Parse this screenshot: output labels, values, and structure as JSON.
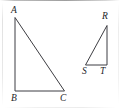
{
  "figure": {
    "name": "two-right-triangles-diagram",
    "background_color": "#ffffff",
    "stroke_color": "#3d3d42",
    "label_color": "#242428",
    "width": 120,
    "height": 109
  },
  "shapes": [
    {
      "name": "triangle-ABC",
      "points": "15,18 15,91 64,91",
      "right_angle_at": "B"
    },
    {
      "name": "triangle-RST",
      "points": "107,26 107,65 86,65",
      "right_angle_at": "T"
    }
  ],
  "labels": {
    "a": "A",
    "b": "B",
    "c": "C",
    "r": "R",
    "s": "S",
    "t": "T"
  },
  "label_positions": {
    "a": {
      "left": 11,
      "top": 5
    },
    "b": {
      "left": 11,
      "top": 93
    },
    "c": {
      "left": 60,
      "top": 93
    },
    "r": {
      "left": 102,
      "top": 11
    },
    "s": {
      "left": 82,
      "top": 66
    },
    "t": {
      "left": 100,
      "top": 66
    }
  }
}
